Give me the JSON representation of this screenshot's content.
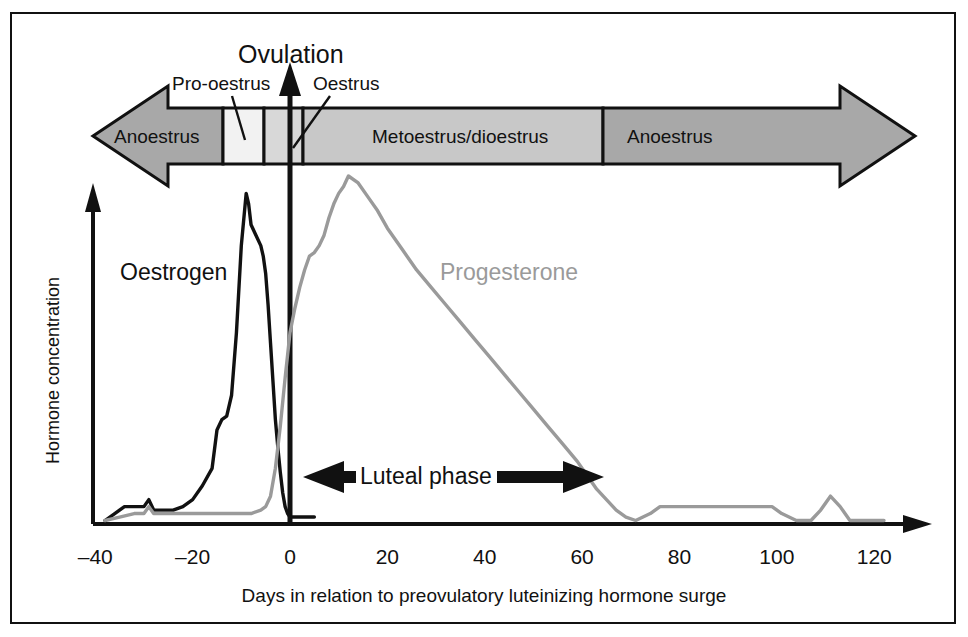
{
  "figure": {
    "ovulation_label": "Ovulation",
    "luteal_phase_label": "Luteal phase",
    "oestrogen_label": "Oestrogen",
    "progesterone_label": "Progesterone"
  },
  "phases": {
    "pro_oestrus": "Pro-oestrus",
    "oestrus": "Oestrus",
    "anoestrus_left": "Anoestrus",
    "metoestrus": "Metoestrus/dioestrus",
    "anoestrus_right": "Anoestrus"
  },
  "colors": {
    "anoestrus_fill": "#a8a8a8",
    "metoestrus_fill": "#c8c8c8",
    "pro_oestrus_fill": "#f2f2f2",
    "oestrus_fill": "#d8d8d8",
    "oestrogen_line": "#111111",
    "progesterone_line": "#9a9a9a",
    "axis": "#111111",
    "border": "#111111"
  },
  "chart_data": {
    "type": "line",
    "title": "",
    "xlabel": "Days in relation to preovulatory luteinizing hormone surge",
    "ylabel": "Hormone concentration",
    "xlim": [
      -45,
      125
    ],
    "ylim": [
      0,
      100
    ],
    "grid": false,
    "legend": "inline-labels",
    "xticks": [
      -40,
      -20,
      0,
      20,
      40,
      60,
      80,
      100,
      120
    ],
    "xtick_labels": [
      "–40",
      "–20",
      "0",
      "20",
      "40",
      "60",
      "80",
      "100",
      "120"
    ],
    "yticks": [],
    "series": [
      {
        "name": "Oestrogen",
        "color": "#111111",
        "x": [
          -38,
          -36,
          -34,
          -32,
          -30,
          -29,
          -28,
          -26,
          -24,
          -22,
          -20,
          -18,
          -16,
          -15,
          -14,
          -13,
          -12,
          -11,
          -10,
          -9,
          -8.5,
          -8,
          -7,
          -6,
          -5.5,
          -5,
          -4.5,
          -4,
          -3.5,
          -3,
          -2.5,
          -2,
          -1.5,
          -1,
          -0.5,
          0,
          1,
          3,
          5
        ],
        "y": [
          1,
          3,
          5,
          5,
          5,
          7,
          4,
          4,
          4,
          5,
          7,
          11,
          16,
          27,
          30,
          31,
          37,
          55,
          80,
          95,
          92,
          86,
          83,
          80,
          77,
          72,
          63,
          52,
          41,
          30,
          22,
          15,
          9,
          5,
          3,
          2,
          2,
          2,
          2
        ]
      },
      {
        "name": "Progesterone",
        "color": "#9a9a9a",
        "x": [
          -38,
          -35,
          -32,
          -30,
          -29,
          -28,
          -26,
          -24,
          -20,
          -16,
          -12,
          -8,
          -6,
          -5,
          -4,
          -3,
          -2,
          -1,
          0,
          1,
          2,
          3,
          4,
          5,
          6,
          7,
          8,
          9,
          10,
          11,
          12,
          14,
          16,
          18,
          20,
          23,
          26,
          29,
          32,
          35,
          38,
          41,
          44,
          47,
          50,
          53,
          56,
          59,
          61,
          63,
          65,
          67,
          69,
          71,
          74,
          76,
          80,
          85,
          90,
          95,
          99,
          101,
          104,
          107,
          109,
          111,
          113,
          115,
          118,
          122
        ],
        "y": [
          1,
          2,
          3,
          3,
          5,
          3,
          3,
          3,
          3,
          3,
          3,
          3,
          4,
          5,
          8,
          16,
          28,
          42,
          55,
          62,
          68,
          73,
          77,
          78,
          80,
          83,
          88,
          92,
          95,
          97,
          100,
          98,
          94,
          90,
          85,
          79,
          73,
          68,
          63,
          58,
          53,
          48,
          43,
          38,
          33,
          28,
          23,
          18,
          14,
          10,
          7,
          4,
          2,
          1,
          3,
          5,
          5,
          5,
          5,
          5,
          5,
          3,
          1,
          1,
          4,
          8,
          5,
          1,
          1,
          1
        ]
      }
    ],
    "annotations": [
      {
        "name": "ovulation-marker",
        "text": "Ovulation",
        "x": 0,
        "type": "vertical-line-with-up-arrow"
      },
      {
        "name": "luteal-phase-span",
        "text": "Luteal phase",
        "x_start": 0,
        "x_end": 63,
        "type": "double-headed-arrow"
      }
    ],
    "phase_bands": [
      {
        "name": "Anoestrus",
        "x_start": -45,
        "x_end": -13.8,
        "fill": "#a8a8a8"
      },
      {
        "name": "Pro-oestrus",
        "x_start": -13.8,
        "x_end": -5.5,
        "fill": "#f2f2f2"
      },
      {
        "name": "Oestrus",
        "x_start": -5.5,
        "x_end": 2.5,
        "fill": "#d8d8d8"
      },
      {
        "name": "Metoestrus/dioestrus",
        "x_start": 2.5,
        "x_end": 63,
        "fill": "#c8c8c8"
      },
      {
        "name": "Anoestrus",
        "x_start": 63,
        "x_end": 125,
        "fill": "#a8a8a8"
      }
    ]
  }
}
